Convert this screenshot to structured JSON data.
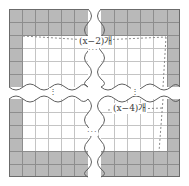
{
  "figure": {
    "width": 189,
    "height": 186,
    "background": "#ffffff",
    "colors": {
      "shaded_cell": "#b9b9b9",
      "plain_cell": "#ffffff",
      "grid_line": "#8d8d8d",
      "inner_grid_line": "#c4c4c4",
      "outer_border": "#6b6b6b",
      "dash_line": "#8a8a8a",
      "label_text": "#3a3a3a"
    }
  },
  "labels": {
    "top": {
      "prefix": "(",
      "variable": "x",
      "minus": "−",
      "number": "2",
      "suffix": ")개",
      "full": "(x−2)개"
    },
    "bottom": {
      "prefix": "(",
      "variable": "x",
      "minus": "−",
      "number": "4",
      "suffix": ")개",
      "full": "(x−4)개"
    }
  },
  "ellipses": {
    "horizontal_top": "···",
    "horizontal_bottom": "···",
    "vertical_left": "⋮",
    "vertical_right": "⋮"
  },
  "grid": {
    "columns_visible_per_half": 6,
    "rows_visible_per_half": 6,
    "frame_thickness_cells": 1,
    "note": "Shaded band forms the outer frame of the square; interior cells are white"
  }
}
